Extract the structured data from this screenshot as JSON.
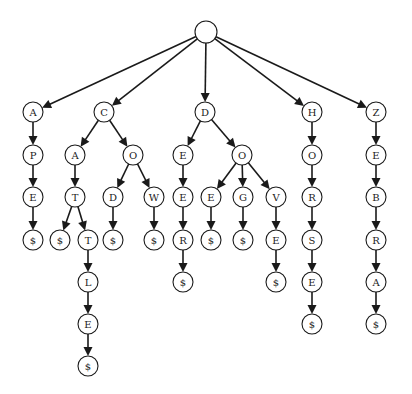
{
  "diagram": {
    "type": "trie",
    "words": [
      "APE",
      "CAT",
      "CATTLE",
      "COD",
      "COW",
      "DEER",
      "DOE",
      "DOG",
      "DOVE",
      "HORSE",
      "ZEBRA"
    ],
    "colors": {
      "stroke": "#1a1a1a",
      "fill": "#ffffff",
      "background": "#ffffff"
    },
    "nodes": [
      {
        "id": "root",
        "label": "",
        "x": 206,
        "y": 32,
        "r": 11
      },
      {
        "id": "a",
        "label": "A",
        "x": 33,
        "y": 112,
        "r": 10
      },
      {
        "id": "ap",
        "label": "P",
        "x": 33,
        "y": 155,
        "r": 10
      },
      {
        "id": "ape",
        "label": "E",
        "x": 33,
        "y": 197,
        "r": 10
      },
      {
        "id": "ape$",
        "label": "$",
        "x": 33,
        "y": 240,
        "r": 10
      },
      {
        "id": "c",
        "label": "C",
        "x": 104,
        "y": 112,
        "r": 10
      },
      {
        "id": "ca",
        "label": "A",
        "x": 75,
        "y": 155,
        "r": 10
      },
      {
        "id": "cat",
        "label": "T",
        "x": 75,
        "y": 197,
        "r": 10
      },
      {
        "id": "cat$",
        "label": "$",
        "x": 60,
        "y": 240,
        "r": 10
      },
      {
        "id": "catt",
        "label": "T",
        "x": 88,
        "y": 240,
        "r": 10
      },
      {
        "id": "cattl",
        "label": "L",
        "x": 88,
        "y": 282,
        "r": 10
      },
      {
        "id": "cattle",
        "label": "E",
        "x": 88,
        "y": 324,
        "r": 10
      },
      {
        "id": "cattle$",
        "label": "$",
        "x": 88,
        "y": 366,
        "r": 10
      },
      {
        "id": "co",
        "label": "O",
        "x": 133,
        "y": 155,
        "r": 10
      },
      {
        "id": "cod",
        "label": "D",
        "x": 113,
        "y": 197,
        "r": 10
      },
      {
        "id": "cod$",
        "label": "$",
        "x": 113,
        "y": 240,
        "r": 10
      },
      {
        "id": "cow",
        "label": "W",
        "x": 154,
        "y": 197,
        "r": 10
      },
      {
        "id": "cow$",
        "label": "$",
        "x": 154,
        "y": 240,
        "r": 10
      },
      {
        "id": "d",
        "label": "D",
        "x": 205,
        "y": 112,
        "r": 10
      },
      {
        "id": "de",
        "label": "E",
        "x": 183,
        "y": 155,
        "r": 10
      },
      {
        "id": "dee",
        "label": "E",
        "x": 183,
        "y": 197,
        "r": 10
      },
      {
        "id": "deer",
        "label": "R",
        "x": 183,
        "y": 240,
        "r": 10
      },
      {
        "id": "deer$",
        "label": "$",
        "x": 183,
        "y": 282,
        "r": 10
      },
      {
        "id": "do",
        "label": "O",
        "x": 242,
        "y": 155,
        "r": 10
      },
      {
        "id": "doe",
        "label": "E",
        "x": 211,
        "y": 197,
        "r": 10
      },
      {
        "id": "doe$",
        "label": "$",
        "x": 211,
        "y": 240,
        "r": 10
      },
      {
        "id": "dog",
        "label": "G",
        "x": 243,
        "y": 197,
        "r": 10
      },
      {
        "id": "dog$",
        "label": "$",
        "x": 243,
        "y": 240,
        "r": 10
      },
      {
        "id": "dov",
        "label": "V",
        "x": 276,
        "y": 197,
        "r": 10
      },
      {
        "id": "dove",
        "label": "E",
        "x": 276,
        "y": 240,
        "r": 10
      },
      {
        "id": "dove$",
        "label": "$",
        "x": 276,
        "y": 282,
        "r": 10
      },
      {
        "id": "h",
        "label": "H",
        "x": 312,
        "y": 112,
        "r": 10
      },
      {
        "id": "ho",
        "label": "O",
        "x": 312,
        "y": 155,
        "r": 10
      },
      {
        "id": "hor",
        "label": "R",
        "x": 312,
        "y": 197,
        "r": 10
      },
      {
        "id": "hors",
        "label": "S",
        "x": 312,
        "y": 240,
        "r": 10
      },
      {
        "id": "horse",
        "label": "E",
        "x": 312,
        "y": 282,
        "r": 10
      },
      {
        "id": "horse$",
        "label": "$",
        "x": 312,
        "y": 324,
        "r": 10
      },
      {
        "id": "z",
        "label": "Z",
        "x": 376,
        "y": 112,
        "r": 10
      },
      {
        "id": "ze",
        "label": "E",
        "x": 376,
        "y": 155,
        "r": 10
      },
      {
        "id": "zeb",
        "label": "B",
        "x": 376,
        "y": 197,
        "r": 10
      },
      {
        "id": "zebr",
        "label": "R",
        "x": 376,
        "y": 240,
        "r": 10
      },
      {
        "id": "zebra",
        "label": "A",
        "x": 376,
        "y": 282,
        "r": 10
      },
      {
        "id": "zebra$",
        "label": "$",
        "x": 376,
        "y": 324,
        "r": 10
      }
    ],
    "edges": [
      [
        "root",
        "a"
      ],
      [
        "root",
        "c"
      ],
      [
        "root",
        "d"
      ],
      [
        "root",
        "h"
      ],
      [
        "root",
        "z"
      ],
      [
        "a",
        "ap"
      ],
      [
        "ap",
        "ape"
      ],
      [
        "ape",
        "ape$"
      ],
      [
        "c",
        "ca"
      ],
      [
        "c",
        "co"
      ],
      [
        "ca",
        "cat"
      ],
      [
        "cat",
        "cat$"
      ],
      [
        "cat",
        "catt"
      ],
      [
        "catt",
        "cattl"
      ],
      [
        "cattl",
        "cattle"
      ],
      [
        "cattle",
        "cattle$"
      ],
      [
        "co",
        "cod"
      ],
      [
        "co",
        "cow"
      ],
      [
        "cod",
        "cod$"
      ],
      [
        "cow",
        "cow$"
      ],
      [
        "d",
        "de"
      ],
      [
        "d",
        "do"
      ],
      [
        "de",
        "dee"
      ],
      [
        "dee",
        "deer"
      ],
      [
        "deer",
        "deer$"
      ],
      [
        "do",
        "doe"
      ],
      [
        "do",
        "dog"
      ],
      [
        "do",
        "dov"
      ],
      [
        "doe",
        "doe$"
      ],
      [
        "dog",
        "dog$"
      ],
      [
        "dov",
        "dove"
      ],
      [
        "dove",
        "dove$"
      ],
      [
        "h",
        "ho"
      ],
      [
        "ho",
        "hor"
      ],
      [
        "hor",
        "hors"
      ],
      [
        "hors",
        "horse"
      ],
      [
        "horse",
        "horse$"
      ],
      [
        "z",
        "ze"
      ],
      [
        "ze",
        "zeb"
      ],
      [
        "zeb",
        "zebr"
      ],
      [
        "zebr",
        "zebra"
      ],
      [
        "zebra",
        "zebra$"
      ]
    ]
  }
}
